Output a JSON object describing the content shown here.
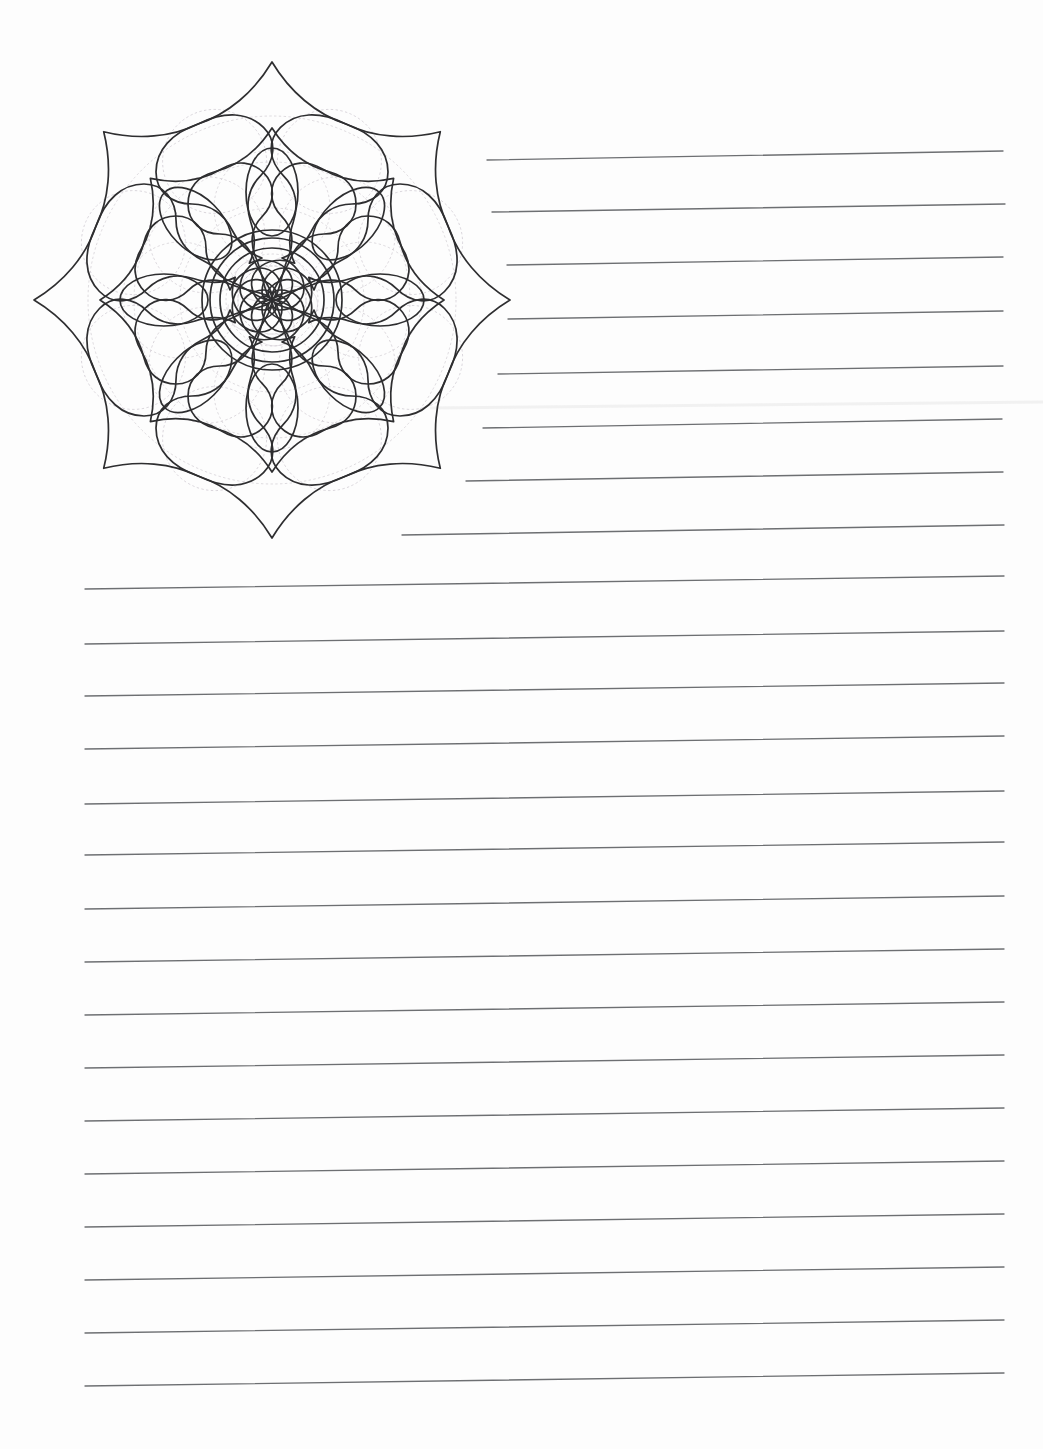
{
  "page": {
    "width": 1043,
    "height": 1449,
    "background_color": "#fdfdfd",
    "paper_type": "lined-writing-paper",
    "orientation": "portrait"
  },
  "artwork": {
    "name": "mandala-illustration",
    "description": "Eight-fold symmetric mandala line drawing with concentric center circles, oval petal ring, and two layers of pointed star petals with heart-shaped notches",
    "center_x": 272,
    "center_y": 300,
    "outer_radius": 232,
    "symmetry": 8,
    "stroke_color": "#2e2e30",
    "guide_color": "#c9c3cb",
    "fill_color": "none",
    "layers": [
      {
        "name": "inner-core-circle",
        "radius": 52
      },
      {
        "name": "middle-core-circle",
        "radius": 62
      },
      {
        "name": "outer-core-circle",
        "radius": 70
      },
      {
        "name": "oval-petal-ring",
        "count": 8,
        "radius": 108
      },
      {
        "name": "inner-star-petals",
        "count": 8,
        "radius": 160
      },
      {
        "name": "outer-star-petals",
        "count": 8,
        "radius": 232
      }
    ]
  },
  "rules": {
    "stroke_color": "#6d6f72",
    "stroke_width": 1.35,
    "short_lines_note": "Upper-right lines beside the mandala",
    "full_lines_note": "Full-width lines across the lower page",
    "short_lines": [
      {
        "index": 1,
        "x1": 487,
        "y1": 160,
        "x2": 1003,
        "y2": 151
      },
      {
        "index": 2,
        "x1": 492,
        "y1": 212,
        "x2": 1005,
        "y2": 204
      },
      {
        "index": 3,
        "x1": 507,
        "y1": 265,
        "x2": 1003,
        "y2": 257
      },
      {
        "index": 4,
        "x1": 508,
        "y1": 319,
        "x2": 1003,
        "y2": 311
      },
      {
        "index": 5,
        "x1": 498,
        "y1": 374,
        "x2": 1003,
        "y2": 366
      },
      {
        "index": 6,
        "x1": 483,
        "y1": 428,
        "x2": 1002,
        "y2": 419
      },
      {
        "index": 7,
        "x1": 466,
        "y1": 481,
        "x2": 1003,
        "y2": 472
      },
      {
        "index": 8,
        "x1": 402,
        "y1": 535,
        "x2": 1004,
        "y2": 525
      }
    ],
    "full_lines": [
      {
        "index": 1,
        "x1": 85,
        "y1": 589,
        "x2": 1004,
        "y2": 576
      },
      {
        "index": 2,
        "x1": 85,
        "y1": 644,
        "x2": 1004,
        "y2": 631
      },
      {
        "index": 3,
        "x1": 85,
        "y1": 696,
        "x2": 1004,
        "y2": 683
      },
      {
        "index": 4,
        "x1": 85,
        "y1": 749,
        "x2": 1004,
        "y2": 736
      },
      {
        "index": 5,
        "x1": 85,
        "y1": 804,
        "x2": 1004,
        "y2": 791
      },
      {
        "index": 6,
        "x1": 85,
        "y1": 855,
        "x2": 1004,
        "y2": 842
      },
      {
        "index": 7,
        "x1": 85,
        "y1": 909,
        "x2": 1004,
        "y2": 896
      },
      {
        "index": 8,
        "x1": 85,
        "y1": 962,
        "x2": 1004,
        "y2": 949
      },
      {
        "index": 9,
        "x1": 85,
        "y1": 1015,
        "x2": 1004,
        "y2": 1002
      },
      {
        "index": 10,
        "x1": 85,
        "y1": 1068,
        "x2": 1004,
        "y2": 1055
      },
      {
        "index": 11,
        "x1": 85,
        "y1": 1121,
        "x2": 1004,
        "y2": 1108
      },
      {
        "index": 12,
        "x1": 85,
        "y1": 1174,
        "x2": 1004,
        "y2": 1161
      },
      {
        "index": 13,
        "x1": 85,
        "y1": 1227,
        "x2": 1004,
        "y2": 1214
      },
      {
        "index": 14,
        "x1": 85,
        "y1": 1280,
        "x2": 1004,
        "y2": 1267
      },
      {
        "index": 15,
        "x1": 85,
        "y1": 1333,
        "x2": 1004,
        "y2": 1320
      },
      {
        "index": 16,
        "x1": 85,
        "y1": 1386,
        "x2": 1004,
        "y2": 1373
      }
    ]
  }
}
